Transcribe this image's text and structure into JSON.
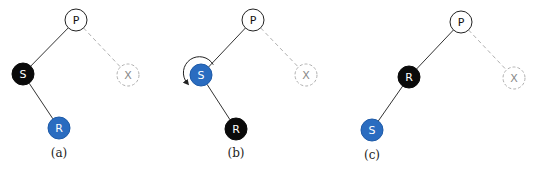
{
  "colors": {
    "black_node": "#0a0a0a",
    "blue_node": "#2a6cc0",
    "white_node": "#ffffff",
    "edge": "#333333",
    "dashed": "#b0b0b0"
  },
  "panels": [
    {
      "caption": "(a)",
      "nodes": [
        {
          "id": "P",
          "label": "P",
          "x": 76,
          "y": 20,
          "style": "white"
        },
        {
          "id": "S",
          "label": "S",
          "x": 23,
          "y": 74,
          "style": "black"
        },
        {
          "id": "X",
          "label": "X",
          "x": 128,
          "y": 75,
          "style": "dashed"
        },
        {
          "id": "R",
          "label": "R",
          "x": 59,
          "y": 128,
          "style": "blue"
        }
      ],
      "edges": [
        [
          "P",
          "S",
          "solid"
        ],
        [
          "P",
          "X",
          "dashed"
        ],
        [
          "S",
          "R",
          "solid"
        ]
      ],
      "caption_pos": {
        "x": 59,
        "y": 157
      }
    },
    {
      "caption": "(b)",
      "nodes": [
        {
          "id": "P",
          "label": "P",
          "x": 253,
          "y": 20,
          "style": "white"
        },
        {
          "id": "S",
          "label": "S",
          "x": 201,
          "y": 75,
          "style": "blue"
        },
        {
          "id": "X",
          "label": "X",
          "x": 306,
          "y": 75,
          "style": "dashed"
        },
        {
          "id": "R",
          "label": "R",
          "x": 236,
          "y": 129,
          "style": "black"
        }
      ],
      "edges": [
        [
          "P",
          "S",
          "solid"
        ],
        [
          "P",
          "X",
          "dashed"
        ],
        [
          "S",
          "R",
          "solid"
        ]
      ],
      "rotation_arrow": {
        "around": "S",
        "direction": "counterclockwise"
      },
      "caption_pos": {
        "x": 236,
        "y": 157
      }
    },
    {
      "caption": "(c)",
      "nodes": [
        {
          "id": "P",
          "label": "P",
          "x": 461,
          "y": 22,
          "style": "white"
        },
        {
          "id": "R",
          "label": "R",
          "x": 409,
          "y": 77,
          "style": "black"
        },
        {
          "id": "X",
          "label": "X",
          "x": 514,
          "y": 78,
          "style": "dashed"
        },
        {
          "id": "S",
          "label": "S",
          "x": 372,
          "y": 130,
          "style": "blue"
        }
      ],
      "edges": [
        [
          "P",
          "R",
          "solid"
        ],
        [
          "P",
          "X",
          "dashed"
        ],
        [
          "R",
          "S",
          "solid"
        ]
      ],
      "caption_pos": {
        "x": 372,
        "y": 159
      }
    }
  ]
}
